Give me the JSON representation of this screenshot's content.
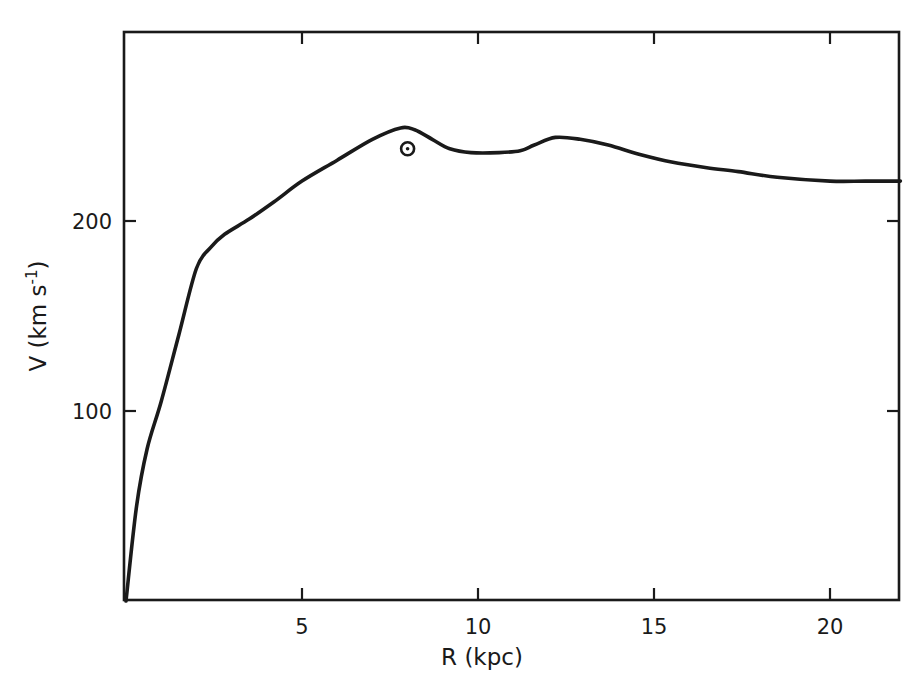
{
  "chart_data": {
    "type": "line",
    "title": "",
    "xlabel": "R (kpc)",
    "ylabel": "V (km s⁻¹)",
    "xlim": [
      0,
      22
    ],
    "ylim": [
      0,
      300
    ],
    "grid": false,
    "legend": null,
    "x_ticks": [
      5,
      10,
      15,
      20
    ],
    "x_tick_labels": [
      "5",
      "10",
      "15",
      "20"
    ],
    "y_ticks": [
      100,
      200
    ],
    "y_tick_labels": [
      "100",
      "200"
    ],
    "series": [
      {
        "name": "Galactic rotation curve",
        "x": [
          0,
          0.3,
          0.6,
          1.0,
          1.5,
          2.0,
          2.4,
          2.8,
          3.5,
          4.2,
          5.0,
          6.0,
          7.0,
          7.8,
          8.2,
          8.7,
          9.2,
          9.8,
          10.6,
          11.2,
          11.6,
          12.2,
          12.9,
          13.7,
          14.6,
          15.5,
          16.5,
          17.4,
          18.5,
          20.0,
          21.0,
          22.0
        ],
        "y": [
          0,
          50,
          80,
          105,
          140,
          175,
          186,
          193,
          201,
          210,
          221,
          232,
          243,
          249,
          248,
          243,
          238,
          236,
          236,
          237,
          240,
          244,
          243,
          240,
          235,
          231,
          228,
          226,
          223,
          221,
          221,
          221
        ]
      }
    ],
    "annotations": [
      {
        "type": "marker",
        "symbol": "sun",
        "label": "⊙",
        "x": 8.0,
        "y": 238,
        "description": "Sun position"
      }
    ]
  },
  "axes": {
    "x_label": "R (kpc)",
    "y_label_main": "V (km s",
    "y_label_sup": "-1",
    "y_label_close": ")"
  }
}
